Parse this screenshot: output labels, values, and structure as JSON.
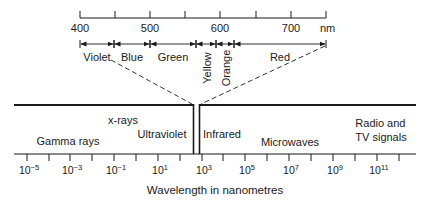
{
  "visible_scale": {
    "unit": "nm",
    "ticks": [
      {
        "value": 400,
        "label": "400",
        "x": 80
      },
      {
        "value": 450,
        "label": "",
        "x": 115
      },
      {
        "value": 500,
        "label": "500",
        "x": 150
      },
      {
        "value": 550,
        "label": "",
        "x": 185
      },
      {
        "value": 600,
        "label": "600",
        "x": 220
      },
      {
        "value": 650,
        "label": "",
        "x": 256
      },
      {
        "value": 700,
        "label": "700",
        "x": 291
      },
      {
        "value": 750,
        "label": "",
        "x": 326
      }
    ],
    "bands": [
      {
        "name": "Violet",
        "start_x": 80,
        "end_x": 114,
        "orientation": "horizontal"
      },
      {
        "name": "Blue",
        "start_x": 114,
        "end_x": 150,
        "orientation": "horizontal"
      },
      {
        "name": "Green",
        "start_x": 150,
        "end_x": 196,
        "orientation": "horizontal"
      },
      {
        "name": "Yellow",
        "start_x": 196,
        "end_x": 216,
        "orientation": "vertical"
      },
      {
        "name": "Orange",
        "start_x": 216,
        "end_x": 234,
        "orientation": "vertical"
      },
      {
        "name": "Red",
        "start_x": 234,
        "end_x": 326,
        "orientation": "horizontal"
      }
    ]
  },
  "full_spectrum": {
    "regions": [
      {
        "name": "Gamma rays",
        "lines": [
          "Gamma rays"
        ],
        "x": 68,
        "y": 134
      },
      {
        "name": "x-rays",
        "lines": [
          "x-rays"
        ],
        "x": 123,
        "y": 113
      },
      {
        "name": "Ultraviolet",
        "lines": [
          "Ultraviolet"
        ],
        "x": 162,
        "y": 127
      },
      {
        "name": "Infrared",
        "lines": [
          "Infrared"
        ],
        "x": 222,
        "y": 127
      },
      {
        "name": "Microwaves",
        "lines": [
          "Microwaves"
        ],
        "x": 290,
        "y": 135
      },
      {
        "name": "Radio and TV signals",
        "lines": [
          "Radio and",
          "TV signals"
        ],
        "x": 381,
        "y": 116
      }
    ],
    "axis_ticks": [
      {
        "exp": -5,
        "label_base": "10",
        "label_exp": "−5",
        "x": 27
      },
      {
        "exp": -4,
        "label_base": "",
        "label_exp": "",
        "x": 49
      },
      {
        "exp": -3,
        "label_base": "10",
        "label_exp": "−3",
        "x": 70
      },
      {
        "exp": -2,
        "label_base": "",
        "label_exp": "",
        "x": 92
      },
      {
        "exp": -1,
        "label_base": "10",
        "label_exp": "−1",
        "x": 114
      },
      {
        "exp": 0,
        "label_base": "",
        "label_exp": "",
        "x": 136
      },
      {
        "exp": 1,
        "label_base": "10",
        "label_exp": "1",
        "x": 158
      },
      {
        "exp": 2,
        "label_base": "",
        "label_exp": "",
        "x": 180
      },
      {
        "exp": 3,
        "label_base": "10",
        "label_exp": "3",
        "x": 202
      },
      {
        "exp": 4,
        "label_base": "",
        "label_exp": "",
        "x": 223
      },
      {
        "exp": 5,
        "label_base": "10",
        "label_exp": "5",
        "x": 245
      },
      {
        "exp": 6,
        "label_base": "",
        "label_exp": "",
        "x": 267
      },
      {
        "exp": 7,
        "label_base": "10",
        "label_exp": "7",
        "x": 289
      },
      {
        "exp": 8,
        "label_base": "",
        "label_exp": "",
        "x": 311
      },
      {
        "exp": 9,
        "label_base": "10",
        "label_exp": "9",
        "x": 333
      },
      {
        "exp": 10,
        "label_base": "",
        "label_exp": "",
        "x": 355
      },
      {
        "exp": 11,
        "label_base": "10",
        "label_exp": "11",
        "x": 377
      },
      {
        "exp": 12,
        "label_base": "",
        "label_exp": "",
        "x": 399
      }
    ],
    "axis_label": "Wavelength in nanometres"
  },
  "colors": {
    "ink": "#1a1a1a",
    "background": "#ffffff"
  }
}
